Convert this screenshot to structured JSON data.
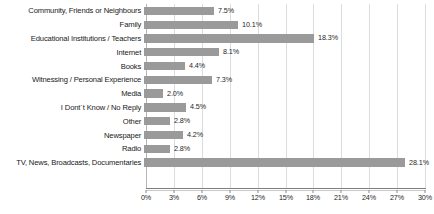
{
  "chart_data": {
    "type": "bar",
    "orientation": "horizontal",
    "title": "",
    "xlabel": "",
    "ylabel": "",
    "xlim": [
      0,
      30
    ],
    "xtick_step": 3,
    "grid": true,
    "legend": false,
    "bar_color": "#9a9a9a",
    "gridline_color": "#dcdcdc",
    "axis_color": "#7d7d7d",
    "label_color": "#1a1a1a",
    "value_suffix": "%",
    "categories": [
      "Community, Friends or Neighbours",
      "Family",
      "Educational Institutions / Teachers",
      "Internet",
      "Books",
      "Witnessing / Personal Experience",
      "Media",
      "I Dont´t Know / No Reply",
      "Other",
      "Newspaper",
      "Radio",
      "TV, News, Broadcasts, Documentaries"
    ],
    "values": [
      7.5,
      10.1,
      18.3,
      8.1,
      4.4,
      7.3,
      2.0,
      4.5,
      2.8,
      4.2,
      2.8,
      28.1
    ],
    "value_labels": [
      "7.5%",
      "10.1%",
      "18.3%",
      "8.1%",
      "4.4%",
      "7.3%",
      "2.0%",
      "4.5%",
      "2.8%",
      "4.2%",
      "2.8%",
      "28.1%"
    ],
    "xticks": [
      0,
      3,
      6,
      9,
      12,
      15,
      18,
      21,
      24,
      27,
      30
    ],
    "xtick_labels": [
      "0%",
      "3%",
      "6%",
      "9%",
      "12%",
      "15%",
      "18%",
      "21%",
      "24%",
      "27%",
      "30%"
    ]
  }
}
